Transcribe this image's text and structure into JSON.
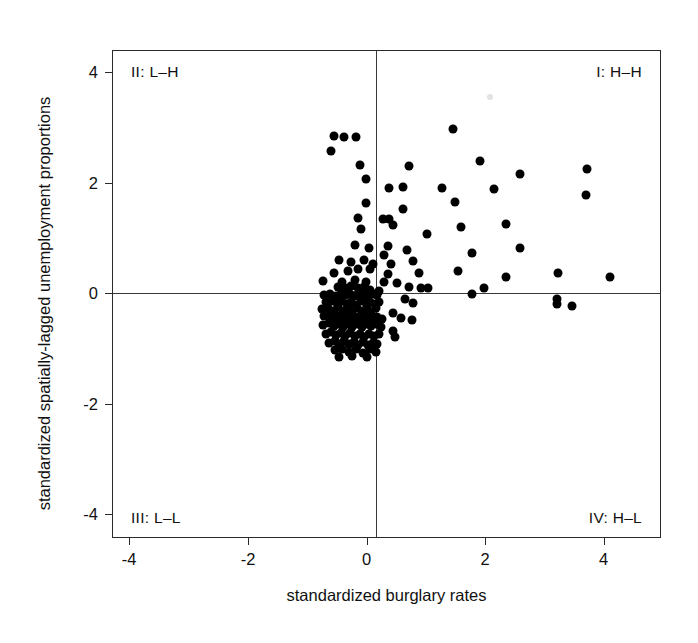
{
  "chart_data": {
    "type": "scatter",
    "title": "",
    "xlabel": "standardized burglary rates",
    "ylabel": "standardized spatially-lagged unemployment proportions",
    "xlim": [
      -4.45,
      4.8
    ],
    "ylim": [
      -4.65,
      4.6
    ],
    "xticks": [
      -4,
      -2,
      0,
      2,
      4
    ],
    "xticklabels": [
      "-4",
      "-2",
      "0",
      "2",
      "4"
    ],
    "yticks": [
      -4,
      -2,
      0,
      2,
      4
    ],
    "yticklabels": [
      "-4",
      "-2",
      "0",
      "2",
      "4"
    ],
    "grid": false,
    "legend": null,
    "reference_lines": {
      "vertical_x": 0,
      "horizontal_y": 0
    },
    "marker": {
      "shape": "circle",
      "color": "#000000",
      "size_px": 9
    },
    "annotations": [
      {
        "name": "quadrant-II",
        "text": "II: L–H",
        "position": "top-left"
      },
      {
        "name": "quadrant-I",
        "text": "I: H–H",
        "position": "top-right"
      },
      {
        "name": "quadrant-III",
        "text": "III: L–L",
        "position": "bottom-left"
      },
      {
        "name": "quadrant-IV",
        "text": "IV: H–L",
        "position": "bottom-right"
      }
    ],
    "points": [
      [
        -0.72,
        2.98
      ],
      [
        -0.55,
        2.96
      ],
      [
        -0.34,
        2.96
      ],
      [
        1.3,
        3.12
      ],
      [
        -0.77,
        2.7
      ],
      [
        -0.28,
        2.43
      ],
      [
        0.56,
        2.42
      ],
      [
        1.75,
        2.5
      ],
      [
        2.43,
        2.25
      ],
      [
        3.57,
        2.35
      ],
      [
        -0.18,
        2.16
      ],
      [
        0.22,
        2.0
      ],
      [
        0.45,
        2.02
      ],
      [
        1.12,
        2.0
      ],
      [
        2.0,
        1.97
      ],
      [
        3.55,
        1.85
      ],
      [
        -0.18,
        1.7
      ],
      [
        0.46,
        1.6
      ],
      [
        1.33,
        1.72
      ],
      [
        -0.3,
        1.42
      ],
      [
        0.22,
        1.4
      ],
      [
        0.12,
        1.4
      ],
      [
        -0.25,
        1.22
      ],
      [
        0.28,
        1.28
      ],
      [
        1.43,
        1.25
      ],
      [
        2.2,
        1.3
      ],
      [
        0.86,
        1.12
      ],
      [
        -0.35,
        0.9
      ],
      [
        -0.12,
        0.85
      ],
      [
        0.2,
        0.88
      ],
      [
        0.52,
        0.82
      ],
      [
        2.43,
        0.85
      ],
      [
        0.14,
        0.72
      ],
      [
        1.62,
        0.75
      ],
      [
        -0.62,
        0.62
      ],
      [
        -0.42,
        0.58
      ],
      [
        -0.2,
        0.62
      ],
      [
        -0.05,
        0.55
      ],
      [
        0.25,
        0.55
      ],
      [
        0.62,
        0.6
      ],
      [
        -0.72,
        0.38
      ],
      [
        -0.48,
        0.42
      ],
      [
        -0.3,
        0.45
      ],
      [
        -0.1,
        0.45
      ],
      [
        0.2,
        0.35
      ],
      [
        0.72,
        0.38
      ],
      [
        1.38,
        0.42
      ],
      [
        2.2,
        0.3
      ],
      [
        3.08,
        0.38
      ],
      [
        3.95,
        0.3
      ],
      [
        -0.9,
        0.22
      ],
      [
        -0.58,
        0.2
      ],
      [
        -0.35,
        0.25
      ],
      [
        -0.18,
        0.2
      ],
      [
        0.14,
        0.2
      ],
      [
        0.35,
        0.18
      ],
      [
        -0.65,
        0.1
      ],
      [
        -0.52,
        0.08
      ],
      [
        -0.42,
        0.12
      ],
      [
        -0.3,
        0.08
      ],
      [
        -0.2,
        0.1
      ],
      [
        -0.1,
        0.05
      ],
      [
        0.05,
        0.04
      ],
      [
        0.55,
        0.1
      ],
      [
        0.75,
        0.08
      ],
      [
        0.88,
        0.08
      ],
      [
        1.62,
        -0.02
      ],
      [
        1.82,
        0.08
      ],
      [
        -0.88,
        -0.05
      ],
      [
        -0.78,
        -0.02
      ],
      [
        -0.68,
        -0.06
      ],
      [
        -0.6,
        -0.03
      ],
      [
        -0.52,
        -0.05
      ],
      [
        -0.45,
        -0.02
      ],
      [
        -0.38,
        -0.06
      ],
      [
        -0.3,
        -0.02
      ],
      [
        -0.22,
        -0.05
      ],
      [
        -0.14,
        -0.04
      ],
      [
        -0.06,
        -0.02
      ],
      [
        0.02,
        -0.05
      ],
      [
        0.48,
        -0.12
      ],
      [
        0.62,
        -0.2
      ],
      [
        3.05,
        -0.12
      ],
      [
        3.05,
        -0.22
      ],
      [
        3.32,
        -0.25
      ],
      [
        -0.85,
        -0.18
      ],
      [
        -0.75,
        -0.15
      ],
      [
        -0.66,
        -0.2
      ],
      [
        -0.58,
        -0.16
      ],
      [
        -0.5,
        -0.22
      ],
      [
        -0.42,
        -0.18
      ],
      [
        -0.34,
        -0.24
      ],
      [
        -0.26,
        -0.16
      ],
      [
        -0.18,
        -0.2
      ],
      [
        -0.1,
        -0.18
      ],
      [
        -0.02,
        -0.22
      ],
      [
        0.05,
        -0.18
      ],
      [
        -0.92,
        -0.32
      ],
      [
        -0.82,
        -0.3
      ],
      [
        -0.72,
        -0.34
      ],
      [
        -0.64,
        -0.28
      ],
      [
        -0.56,
        -0.35
      ],
      [
        -0.48,
        -0.3
      ],
      [
        -0.4,
        -0.36
      ],
      [
        -0.32,
        -0.3
      ],
      [
        -0.24,
        -0.34
      ],
      [
        -0.16,
        -0.3
      ],
      [
        -0.08,
        -0.36
      ],
      [
        0.0,
        -0.3
      ],
      [
        0.28,
        -0.38
      ],
      [
        0.42,
        -0.48
      ],
      [
        0.6,
        -0.52
      ],
      [
        -0.88,
        -0.45
      ],
      [
        -0.78,
        -0.42
      ],
      [
        -0.7,
        -0.48
      ],
      [
        -0.62,
        -0.44
      ],
      [
        -0.54,
        -0.5
      ],
      [
        -0.46,
        -0.45
      ],
      [
        -0.38,
        -0.52
      ],
      [
        -0.3,
        -0.46
      ],
      [
        -0.22,
        -0.5
      ],
      [
        -0.14,
        -0.44
      ],
      [
        -0.06,
        -0.52
      ],
      [
        0.02,
        -0.46
      ],
      [
        0.1,
        -0.5
      ],
      [
        -0.9,
        -0.62
      ],
      [
        -0.8,
        -0.58
      ],
      [
        -0.72,
        -0.64
      ],
      [
        -0.64,
        -0.6
      ],
      [
        -0.56,
        -0.66
      ],
      [
        -0.48,
        -0.6
      ],
      [
        -0.4,
        -0.65
      ],
      [
        -0.32,
        -0.6
      ],
      [
        -0.24,
        -0.66
      ],
      [
        -0.16,
        -0.6
      ],
      [
        -0.08,
        -0.64
      ],
      [
        0.0,
        -0.6
      ],
      [
        0.08,
        -0.66
      ],
      [
        0.28,
        -0.72
      ],
      [
        0.32,
        -0.85
      ],
      [
        -0.85,
        -0.78
      ],
      [
        -0.76,
        -0.74
      ],
      [
        -0.68,
        -0.8
      ],
      [
        -0.6,
        -0.76
      ],
      [
        -0.52,
        -0.82
      ],
      [
        -0.44,
        -0.76
      ],
      [
        -0.36,
        -0.82
      ],
      [
        -0.28,
        -0.78
      ],
      [
        -0.2,
        -0.84
      ],
      [
        -0.12,
        -0.78
      ],
      [
        -0.04,
        -0.82
      ],
      [
        0.04,
        -0.78
      ],
      [
        -0.8,
        -0.95
      ],
      [
        -0.7,
        -0.92
      ],
      [
        -0.62,
        -0.98
      ],
      [
        -0.54,
        -0.92
      ],
      [
        -0.46,
        -0.98
      ],
      [
        -0.38,
        -0.94
      ],
      [
        -0.3,
        -1.0
      ],
      [
        -0.22,
        -0.94
      ],
      [
        -0.14,
        -1.0
      ],
      [
        -0.06,
        -0.95
      ],
      [
        0.02,
        -0.98
      ],
      [
        -0.7,
        -1.1
      ],
      [
        -0.58,
        -1.08
      ],
      [
        -0.46,
        -1.12
      ],
      [
        -0.34,
        -1.08
      ],
      [
        -0.22,
        -1.14
      ],
      [
        -0.1,
        -1.08
      ],
      [
        0.0,
        -1.12
      ],
      [
        -0.62,
        -1.22
      ],
      [
        -0.4,
        -1.2
      ],
      [
        -0.16,
        -1.22
      ]
    ]
  }
}
